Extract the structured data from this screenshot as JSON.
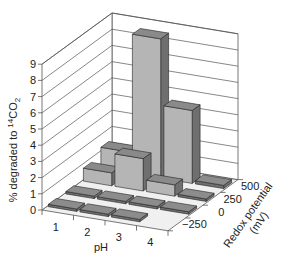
{
  "chart_data": {
    "type": "bar3d",
    "title": "",
    "xlabel": "pH",
    "ylabel": "% degraded to 14CO2",
    "ylabel_parts": {
      "prefix": "% degraded to ",
      "sup": "14",
      "mid": "CO",
      "sub": "2"
    },
    "zlabel_line1": "Redox potential",
    "zlabel_line2": "(mV)",
    "x_categories": [
      "1",
      "2",
      "3",
      "4"
    ],
    "z_categories": [
      "-250",
      "0",
      "250",
      "500"
    ],
    "z_tick_labels": [
      "−250",
      "0",
      "250",
      "500"
    ],
    "y_ticks": [
      "0",
      "1",
      "2",
      "3",
      "4",
      "5",
      "6",
      "7",
      "8",
      "9"
    ],
    "ylim": [
      0,
      9
    ],
    "grid": true,
    "series": [
      {
        "name": "-250",
        "values": [
          0.1,
          0.1,
          0.1,
          null
        ]
      },
      {
        "name": "0",
        "values": [
          0.1,
          0.1,
          0.1,
          0.1
        ]
      },
      {
        "name": "250",
        "values": [
          0.8,
          2.0,
          0.7,
          0.1
        ]
      },
      {
        "name": "500",
        "values": [
          1.3,
          8.6,
          4.5,
          0.2
        ]
      }
    ],
    "colors": {
      "bar_front": "#b5b5b5",
      "bar_top": "#8a8a8a",
      "bar_side": "#6f6f6f",
      "slab_top": "#8c8c8c",
      "floor": "#f0f0f0",
      "grid": "#555555",
      "wall": "#ffffff"
    }
  }
}
